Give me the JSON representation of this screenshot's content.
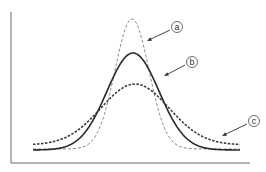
{
  "diagram": {
    "curves": [
      {
        "id": "a",
        "label": "a",
        "style": "thin dashed",
        "relative_peak": "highest",
        "relative_spread": "narrowest",
        "color": "#8a8a8a"
      },
      {
        "id": "b",
        "label": "b",
        "style": "solid",
        "relative_peak": "middle",
        "relative_spread": "medium",
        "color": "#2a2a2a"
      },
      {
        "id": "c",
        "label": "c",
        "style": "bold dotted",
        "relative_peak": "lowest",
        "relative_spread": "widest",
        "color": "#3a3a3a"
      }
    ],
    "axes": {
      "x_label": "",
      "y_label": "",
      "color": "#6a6a6a"
    }
  }
}
